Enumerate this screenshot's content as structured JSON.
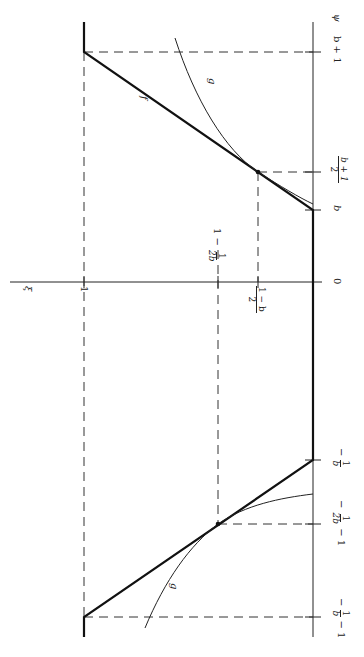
{
  "figure": {
    "orientation": "rotated 90 degrees clockwise",
    "axes": {
      "horizontal_axis_label": "ψ",
      "vertical_axis_label": "ξ"
    },
    "psi_ticks": [
      {
        "id": "neg_inv_b_minus_1",
        "label_pre": "−",
        "num": "1",
        "den": "b",
        "label_post": " − 1"
      },
      {
        "id": "neg_inv_2b_minus_1",
        "label_pre": "−",
        "num": "1",
        "den": "2b",
        "label_post": " − 1"
      },
      {
        "id": "neg_inv_b",
        "label_pre": "−",
        "num": "1",
        "den": "b",
        "label_post": ""
      },
      {
        "id": "zero",
        "label": "0"
      },
      {
        "id": "b",
        "label": "b"
      },
      {
        "id": "b_plus_1_over_2",
        "num": "b + 1",
        "den": "2"
      },
      {
        "id": "b_plus_1",
        "label": "b + 1"
      }
    ],
    "xi_ticks": [
      {
        "id": "one",
        "label": "1"
      },
      {
        "id": "one_minus_inv_2b",
        "label_pre": "1 − ",
        "num": "1",
        "den": "2b"
      },
      {
        "id": "one_minus_b_over_2",
        "num": "1 − b",
        "den": "2"
      }
    ],
    "curves": [
      {
        "name": "f",
        "style": "bold piecewise linear"
      },
      {
        "name": "g",
        "style": "thin smooth"
      }
    ],
    "curve_labels": {
      "f": "f",
      "g_upper": "g",
      "g_lower": "g"
    },
    "colors": {
      "line": "#1a1a1a",
      "dash": "#333333",
      "background": "#ffffff"
    }
  }
}
